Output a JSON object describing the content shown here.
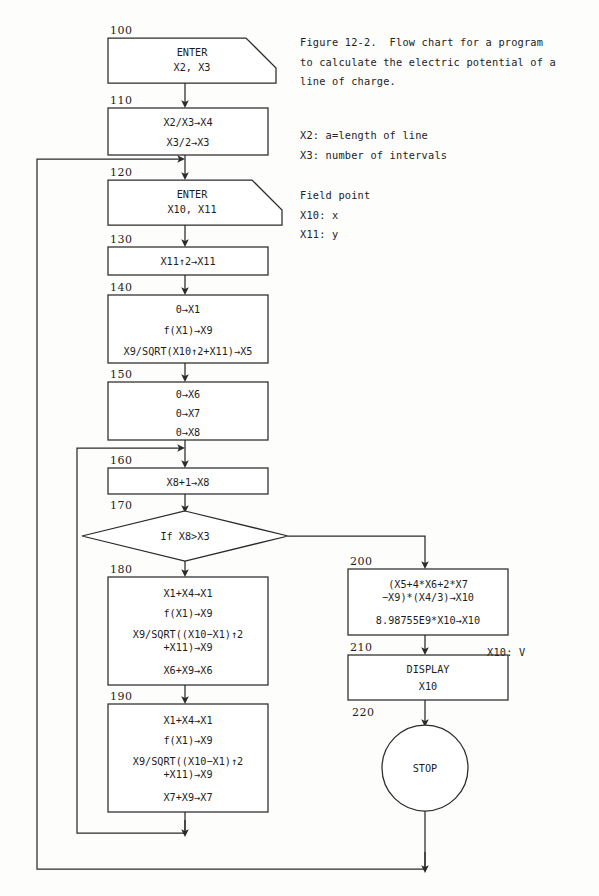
{
  "figure": {
    "caption_lines": [
      "Figure 12-2.  Flow chart for a program",
      "to calculate the electric potential of a",
      "line of charge."
    ],
    "caption_text": "Figure 12-2.  Flow chart for a program\nto calculate the electric potential of a\nline of charge.",
    "variables_text": "X2: a=length of line\nX3: number of intervals",
    "field_point_text": "Field point\nX10: x\nX11: y",
    "output_legend_text": "X10: V"
  },
  "nodes": [
    {
      "id": "n100",
      "line_number": "100",
      "shape": "input-output",
      "lines": [
        "ENTER",
        "X2, X3"
      ]
    },
    {
      "id": "n110",
      "line_number": "110",
      "shape": "process",
      "lines": [
        "X2/X3→X4",
        "X3/2→X3"
      ]
    },
    {
      "id": "n120",
      "line_number": "120",
      "shape": "input-output",
      "lines": [
        "ENTER",
        "X10, X11"
      ]
    },
    {
      "id": "n130",
      "line_number": "130",
      "shape": "process",
      "lines": [
        "X11↑2→X11"
      ]
    },
    {
      "id": "n140",
      "line_number": "140",
      "shape": "process",
      "lines": [
        "0→X1",
        "f(X1)→X9",
        "X9/SQRT(X10↑2+X11)→X5"
      ]
    },
    {
      "id": "n150",
      "line_number": "150",
      "shape": "process",
      "lines": [
        "0→X6",
        "0→X7",
        "0→X8"
      ]
    },
    {
      "id": "n160",
      "line_number": "160",
      "shape": "process",
      "lines": [
        "X8+1→X8"
      ]
    },
    {
      "id": "n170",
      "line_number": "170",
      "shape": "decision",
      "lines": [
        "If X8>X3"
      ]
    },
    {
      "id": "n180",
      "line_number": "180",
      "shape": "process",
      "lines": [
        "X1+X4→X1",
        "f(X1)→X9",
        "X9/SQRT((X10−X1)↑2",
        "+X11)→X9",
        "X6+X9→X6"
      ]
    },
    {
      "id": "n190",
      "line_number": "190",
      "shape": "process",
      "lines": [
        "X1+X4→X1",
        "f(X1)→X9",
        "X9/SQRT((X10−X1)↑2",
        "+X11)→X9",
        "X7+X9→X7"
      ]
    },
    {
      "id": "n200",
      "line_number": "200",
      "shape": "process",
      "lines": [
        "(X5+4*X6+2*X7",
        "−X9)*(X4/3)→X10",
        "8.98755E9*X10→X10"
      ]
    },
    {
      "id": "n210",
      "line_number": "210",
      "shape": "process",
      "lines": [
        "DISPLAY",
        "X10"
      ]
    },
    {
      "id": "n220",
      "line_number": "220",
      "shape": "terminal",
      "lines": [
        "STOP"
      ]
    }
  ],
  "colors": {
    "ink": "#2b2b2b",
    "paper": "#fdfdfc",
    "text": "#1d1d1d"
  }
}
